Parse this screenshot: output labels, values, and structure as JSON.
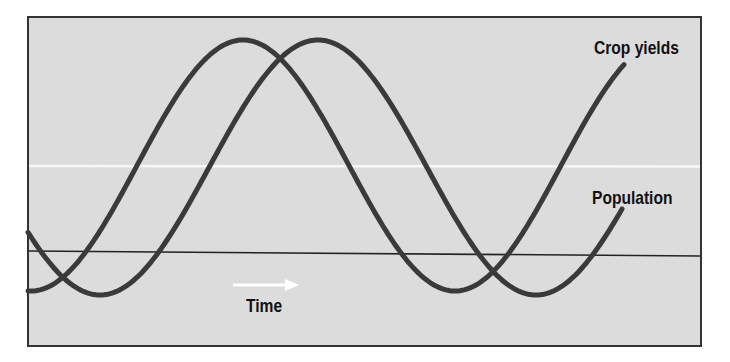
{
  "diagram": {
    "labels": {
      "crop_yields": "Crop yields",
      "population": "Population",
      "time": "Time"
    },
    "colors": {
      "background": "#ffffff",
      "panel_fill": "#dcdcdc",
      "frame": "#333333",
      "curve": "#3a3a3a",
      "baseline": "#222222",
      "white_line": "#f7f7f7",
      "time_arrow": "#ffffff"
    }
  },
  "chart_data": {
    "type": "line",
    "title": "",
    "xlabel": "Time",
    "ylabel": "",
    "grid": false,
    "legend_position": "inline-right",
    "x_units": "px",
    "series": [
      {
        "name": "Crop yields",
        "shape": "sinusoid",
        "start": [
          28,
          295
        ],
        "peaks": [
          [
            243,
            40
          ]
        ],
        "troughs": [
          [
            455,
            291
          ]
        ],
        "end": [
          625,
          70
        ]
      },
      {
        "name": "Population",
        "shape": "sinusoid",
        "start": [
          28,
          225
        ],
        "peaks": [
          [
            318,
            40
          ]
        ],
        "troughs": [
          [
            107,
            292
          ],
          [
            536,
            295
          ]
        ],
        "end": [
          622,
          220
        ]
      }
    ],
    "annotations": [
      {
        "text": "Crop yields",
        "x": 594,
        "y": 37
      },
      {
        "text": "Population",
        "x": 592,
        "y": 187
      },
      {
        "text": "Time",
        "x": 246,
        "y": 295,
        "arrow": "right"
      }
    ]
  }
}
